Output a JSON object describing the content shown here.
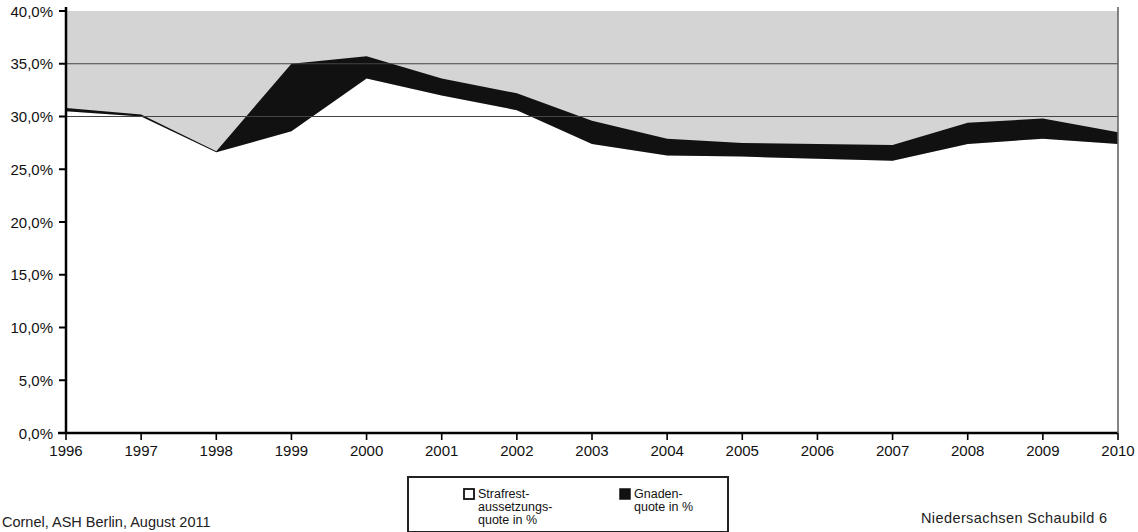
{
  "chart_data": {
    "type": "area",
    "stacked": true,
    "title": "",
    "subtitle": "",
    "xlabel": "",
    "ylabel": "",
    "categories": [
      "1996",
      "1997",
      "1998",
      "1999",
      "2000",
      "2001",
      "2002",
      "2003",
      "2004",
      "2005",
      "2006",
      "2007",
      "2008",
      "2009",
      "2010"
    ],
    "series": [
      {
        "name": "Strafrestaussetzungsquote in %",
        "color": "#d4d4d4",
        "values": [
          30.5,
          30.0,
          26.6,
          28.6,
          33.6,
          32.0,
          30.6,
          27.4,
          26.3,
          26.2,
          26.0,
          25.8,
          27.4,
          27.9,
          27.4
        ]
      },
      {
        "name": "Gnadenquote in %",
        "color": "#111111",
        "values": [
          0.3,
          0.2,
          0.1,
          6.4,
          2.1,
          1.6,
          1.6,
          2.2,
          1.6,
          1.3,
          1.4,
          1.5,
          2.0,
          1.9,
          1.1
        ]
      }
    ],
    "totals": [
      30.8,
      30.2,
      26.7,
      35.0,
      35.7,
      33.6,
      32.2,
      29.6,
      27.9,
      27.5,
      27.4,
      27.3,
      29.4,
      29.8,
      28.5
    ],
    "ylim": [
      0,
      40
    ],
    "y_ticks": [
      "0,0%",
      "5,0%",
      "10,0%",
      "15,0%",
      "20,0%",
      "25,0%",
      "30,0%",
      "35,0%",
      "40,0%"
    ],
    "y_tick_values": [
      0,
      5,
      10,
      15,
      20,
      25,
      30,
      35,
      40
    ],
    "gridlines": [
      30,
      35
    ],
    "grid": true,
    "legend_position": "bottom-center"
  },
  "legend": {
    "entries": [
      {
        "marker": "open-square",
        "label_lines": [
          "Strafrest-",
          "aussetzungs-",
          "quote in %"
        ]
      },
      {
        "marker": "filled-square",
        "label_lines": [
          "Gnaden-",
          "quote in %"
        ]
      }
    ]
  },
  "footer": {
    "source_note": "Cornel, ASH Berlin, August 2011",
    "caption": "Niedersachsen Schaubild 6"
  },
  "colors": {
    "upper_band": "#d4d4d4",
    "lower_band": "#111111",
    "axis": "#000000",
    "gridline": "#444444",
    "background": "#ffffff"
  }
}
